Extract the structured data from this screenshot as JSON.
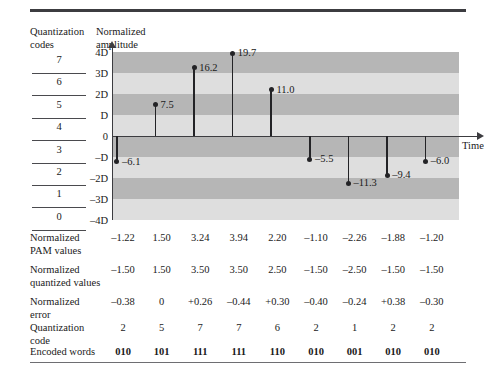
{
  "headers": {
    "quantization_codes": "Quantization\ncodes",
    "normalized_amplitude": "Normalized\namplitude"
  },
  "axis": {
    "time_label": "Time",
    "y_ticks": [
      "4D",
      "3D",
      "2D",
      "D",
      "0",
      "–D",
      "–2D",
      "–3D",
      "–4D"
    ]
  },
  "quantization_code_ladder": [
    "7",
    "6",
    "5",
    "4",
    "3",
    "2",
    "1",
    "0"
  ],
  "table": {
    "rows": [
      {
        "label": "Normalized\nPAM values",
        "values": [
          "–1.22",
          "1.50",
          "3.24",
          "3.94",
          "2.20",
          "–1.10",
          "–2.26",
          "–1.88",
          "–1.20"
        ],
        "bold": false
      },
      {
        "label": "Normalized\nquantized values",
        "values": [
          "–1.50",
          "1.50",
          "3.50",
          "3.50",
          "2.50",
          "–1.50",
          "–2.50",
          "–1.50",
          "–1.50"
        ],
        "bold": false
      },
      {
        "label": "Normalized\nerror",
        "values": [
          "–0.38",
          "0",
          "+0.26",
          "–0.44",
          "+0.30",
          "–0.40",
          "–0.24",
          "+0.38",
          "–0.30"
        ],
        "bold": false
      },
      {
        "label": "Quantization code",
        "values": [
          "2",
          "5",
          "7",
          "7",
          "6",
          "2",
          "1",
          "2",
          "2"
        ],
        "bold": false
      },
      {
        "label": "Encoded words",
        "values": [
          "010",
          "101",
          "111",
          "111",
          "110",
          "010",
          "001",
          "010",
          "010"
        ],
        "bold": true
      }
    ]
  },
  "chart_data": {
    "type": "bar",
    "title": "",
    "xlabel": "Time",
    "ylabel": "Normalized amplitude",
    "categories": [
      "1",
      "2",
      "3",
      "4",
      "5",
      "6",
      "7",
      "8",
      "9"
    ],
    "values": [
      -6.1,
      7.5,
      16.2,
      19.7,
      11.0,
      -5.5,
      -11.3,
      -9.4,
      -6.0
    ],
    "point_labels": [
      "–6.1",
      "7.5",
      "16.2",
      "19.7",
      "11.0",
      "–5.5",
      "–11.3",
      "–9.4",
      "–6.0"
    ],
    "ylim": [
      -20,
      20
    ],
    "ytick_labels": [
      "4D",
      "3D",
      "2D",
      "D",
      "0",
      "–D",
      "–2D",
      "–3D",
      "–4D"
    ],
    "ytick_values": [
      20,
      15,
      10,
      5,
      0,
      -5,
      -10,
      -15,
      -20
    ],
    "grid": false,
    "legend": "none",
    "band_colors": {
      "dark": "#b6b6b6",
      "light": "#dedede"
    },
    "marker": "circle",
    "stem_color": "#232326"
  }
}
